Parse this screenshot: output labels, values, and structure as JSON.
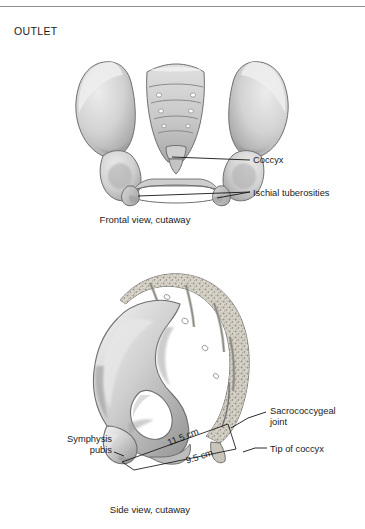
{
  "page": {
    "section_label": "OUTLET",
    "background": "#ffffff",
    "rule_color": "#8e8e8e",
    "text_color": "#1a1a1a"
  },
  "figures": [
    {
      "id": "frontal",
      "caption": "Frontal view, cutaway",
      "labels": [
        {
          "id": "coccyx",
          "text": "Coccyx"
        },
        {
          "id": "ischial-tuberosities",
          "text": "Ischial tuberosities"
        }
      ]
    },
    {
      "id": "side",
      "caption": "Side view, cutaway",
      "labels": [
        {
          "id": "sacrococcygeal-joint",
          "text": "Sacrococcygeal\njoint"
        },
        {
          "id": "tip-of-coccyx",
          "text": "Tip of coccyx"
        },
        {
          "id": "symphysis-pubis",
          "text": "Symphysis\npubis"
        }
      ],
      "measurements": [
        {
          "id": "diameter-upper",
          "text": "11.5 cm"
        },
        {
          "id": "diameter-lower",
          "text": "9.5 cm"
        }
      ]
    }
  ],
  "palette": {
    "bone_light": "#e3e3e3",
    "bone_mid": "#c2c2c2",
    "bone_shadow": "#9a9a9a",
    "bone_dark": "#7d7d7d",
    "outline": "#6d6d6d",
    "trabecular": "#cfcac0",
    "leader": "#151515"
  }
}
